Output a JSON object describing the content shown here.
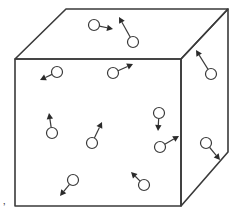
{
  "diagram": {
    "colors": {
      "stroke": "#3a3a3a",
      "arrow_fill": "#2a2a2a",
      "background": "#ffffff"
    },
    "cube": {
      "front_face": [
        [
          15,
          59
        ],
        [
          181,
          59
        ],
        [
          181,
          206
        ],
        [
          15,
          206
        ]
      ],
      "top_face": [
        [
          15,
          59
        ],
        [
          66,
          9
        ],
        [
          228,
          9
        ],
        [
          181,
          59
        ]
      ],
      "right_face": [
        [
          181,
          59
        ],
        [
          228,
          9
        ],
        [
          228,
          152
        ],
        [
          181,
          206
        ]
      ]
    },
    "particles": [
      {
        "id": "p1",
        "face": "top",
        "circle": [
          94,
          25
        ],
        "tip": [
          113,
          29
        ]
      },
      {
        "id": "p2",
        "face": "top",
        "circle": [
          133,
          42
        ],
        "tip": [
          119,
          17
        ]
      },
      {
        "id": "p3",
        "face": "front",
        "circle": [
          57,
          72
        ],
        "tip": [
          40,
          80
        ]
      },
      {
        "id": "p4",
        "face": "front",
        "circle": [
          113,
          73
        ],
        "tip": [
          133,
          64
        ]
      },
      {
        "id": "p5",
        "face": "right",
        "circle": [
          211,
          74
        ],
        "tip": [
          196,
          50
        ]
      },
      {
        "id": "p6",
        "face": "front",
        "circle": [
          52,
          133
        ],
        "tip": [
          49,
          113
        ]
      },
      {
        "id": "p7",
        "face": "front",
        "circle": [
          92,
          143
        ],
        "tip": [
          102,
          122
        ]
      },
      {
        "id": "p8",
        "face": "front",
        "circle": [
          159,
          113
        ],
        "tip": [
          158,
          131
        ]
      },
      {
        "id": "p9",
        "face": "front",
        "circle": [
          160,
          147
        ],
        "tip": [
          179,
          136
        ]
      },
      {
        "id": "p10",
        "face": "right",
        "circle": [
          206,
          143
        ],
        "tip": [
          220,
          160
        ]
      },
      {
        "id": "p11",
        "face": "front",
        "circle": [
          73,
          180
        ],
        "tip": [
          60,
          196
        ]
      },
      {
        "id": "p12",
        "face": "front",
        "circle": [
          144,
          185
        ],
        "tip": [
          131,
          172
        ]
      }
    ],
    "particle_radius": 5.5,
    "stray_mark": {
      "position": [
        3,
        211
      ],
      "glyph": "’"
    }
  }
}
